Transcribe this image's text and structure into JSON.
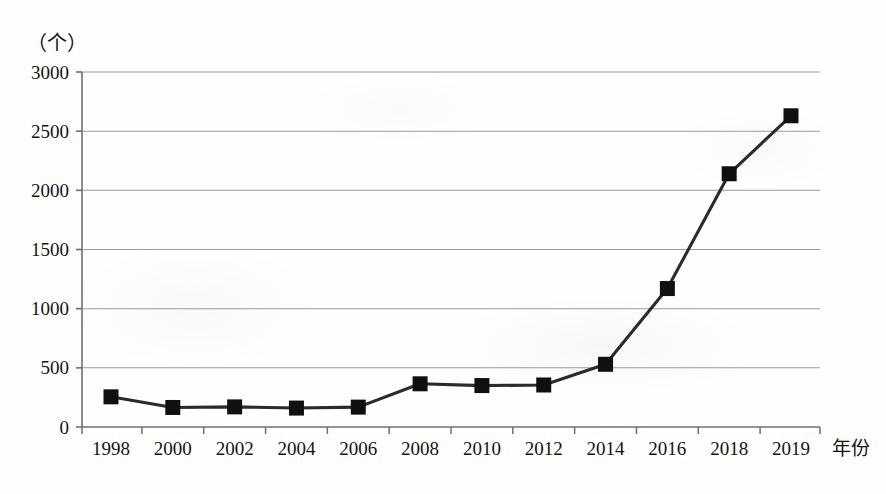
{
  "chart_data": {
    "type": "line",
    "title": "",
    "subtitle": "",
    "xlabel": "年份",
    "ylabel": "（个）",
    "categories": [
      "1998",
      "2000",
      "2002",
      "2004",
      "2006",
      "2008",
      "2010",
      "2012",
      "2014",
      "2016",
      "2018",
      "2019"
    ],
    "x": [
      1998,
      2000,
      2002,
      2004,
      2006,
      2008,
      2010,
      2012,
      2014,
      2016,
      2018,
      2019
    ],
    "values": [
      255,
      165,
      170,
      160,
      168,
      365,
      350,
      355,
      530,
      1170,
      2140,
      2630
    ],
    "series": [
      {
        "name": "",
        "values": [
          255,
          165,
          170,
          160,
          168,
          365,
          350,
          355,
          530,
          1170,
          2140,
          2630
        ]
      }
    ],
    "ylim": [
      0,
      3000
    ],
    "yticks": [
      0,
      500,
      1000,
      1500,
      2000,
      2500,
      3000
    ],
    "ytick_labels": [
      "0",
      "500",
      "1000",
      "1500",
      "2000",
      "2500",
      "3000"
    ],
    "grid": true,
    "grid_axis": "y",
    "legend": "none",
    "marker": "square",
    "marker_color": "#101010",
    "line_color": "#2b2b2b",
    "grid_color": "#8a8a8a",
    "axis_color": "#6b6b6b",
    "annotations": []
  },
  "axes": {
    "y_unit_label": "（个）",
    "x_axis_name": "年份"
  }
}
